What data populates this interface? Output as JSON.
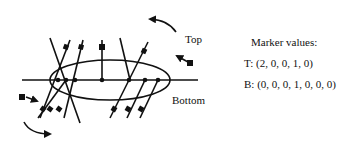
{
  "diagram": {
    "labels": {
      "top": "Top",
      "bottom": "Bottom"
    },
    "panel": {
      "title": "Marker values:",
      "rows": [
        {
          "label": "T: (2, 0, 0, 1, 0)"
        },
        {
          "label": "B: (0, 0, 0, 1, 0, 0, 0)"
        }
      ]
    },
    "elements": {
      "axis": "horizontal-line",
      "region": "ellipse",
      "top_arrow": "curved-arrow-counterclockwise",
      "bottom_arrow": "curved-arrow-clockwise",
      "marker_shape": "filled-square"
    },
    "colors": {
      "stroke": "#111111",
      "background": "#ffffff"
    }
  }
}
